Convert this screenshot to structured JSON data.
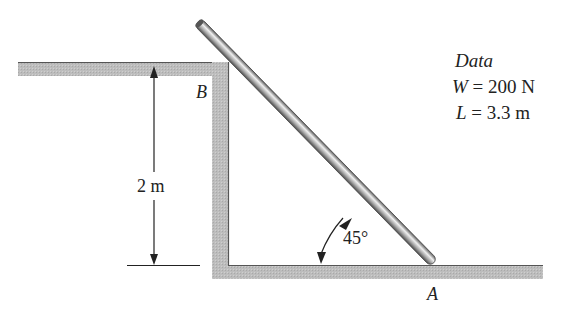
{
  "diagram": {
    "type": "statics-free-body-setup",
    "labels": {
      "point_b": "B",
      "point_a": "A",
      "height": "2 m",
      "angle": "45°"
    },
    "data_box": {
      "title": "Data",
      "lines": [
        {
          "symbol": "W",
          "equals": " = 200 N"
        },
        {
          "symbol": "L",
          "equals": " = 3.3 m"
        }
      ]
    },
    "colors": {
      "surface_fill": "#b8b8b8",
      "surface_edge": "#555555",
      "rod_light": "#e8e8e8",
      "rod_dark": "#6e6e6e",
      "line": "#222222"
    }
  }
}
